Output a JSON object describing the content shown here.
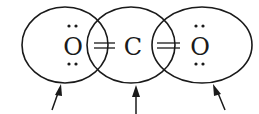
{
  "molecule": {
    "atoms": [
      {
        "symbol": "O",
        "x": 73,
        "lone_pairs": 2
      },
      {
        "symbol": "C",
        "x": 133,
        "lone_pairs": 0
      },
      {
        "symbol": "O",
        "x": 199,
        "lone_pairs": 2
      }
    ],
    "bonds": [
      {
        "type": "double",
        "between": [
          "O",
          "C"
        ]
      },
      {
        "type": "double",
        "between": [
          "C",
          "O"
        ]
      }
    ],
    "orbitals": [
      {
        "cx": 65,
        "cy": 45,
        "rx": 43,
        "ry": 38
      },
      {
        "cx": 131,
        "cy": 45,
        "rx": 44,
        "ry": 38
      },
      {
        "cx": 202,
        "cy": 45,
        "rx": 50,
        "ry": 38
      }
    ],
    "arrows_count": 3
  },
  "colors": {
    "stroke": "#1a1a1a",
    "background": "#ffffff"
  }
}
